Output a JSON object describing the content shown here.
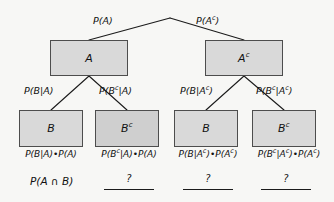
{
  "diagram": {
    "colors": {
      "background": "#f7f7f5",
      "box_fill": "#d9d9d9",
      "box_fill_dark": "#cfcfcf",
      "box_border": "#4d4d4d",
      "line": "#1b1b1b",
      "text": "#111111"
    }
  },
  "nodes": {
    "level1": [
      {
        "id": "A",
        "base": "A",
        "sup": ""
      },
      {
        "id": "Ac",
        "base": "A",
        "sup": "c"
      }
    ],
    "level2": [
      {
        "id": "B1",
        "base": "B",
        "sup": ""
      },
      {
        "id": "Bc1",
        "base": "B",
        "sup": "c"
      },
      {
        "id": "B2",
        "base": "B",
        "sup": ""
      },
      {
        "id": "Bc2",
        "base": "B",
        "sup": "c"
      }
    ]
  },
  "edge_labels": {
    "root_left": {
      "prefix": "P(A",
      "sup": "",
      "suffix": ")"
    },
    "root_right": {
      "prefix": "P(A",
      "sup": "c",
      "suffix": ")"
    },
    "a_left": {
      "text": "P(B|A)"
    },
    "a_right": {
      "prefix": "P(B",
      "sup": "c",
      "suffix": "|A)"
    },
    "ac_left": {
      "prefix": "P(B|A",
      "sup": "c",
      "suffix": ")"
    },
    "ac_right": {
      "prefix": "P(B",
      "sup": "c",
      "mid": "|A",
      "sup2": "c",
      "suffix": ")"
    }
  },
  "products": [
    {
      "p1": "P(B|A)",
      "dot": "•",
      "p2": "P(A)"
    },
    {
      "p1a": "P(B",
      "p1sup": "c",
      "p1b": "|A)",
      "dot": "•",
      "p2": "P(A)"
    },
    {
      "p1a": "P(B|A",
      "p1sup": "c",
      "p1b": ")",
      "dot": "•",
      "p2a": "P(A",
      "p2sup": "c",
      "p2b": ")"
    },
    {
      "p1a": "P(B",
      "p1sup": "c",
      "p1mid": "|A",
      "p1sup2": "c",
      "p1b": ")",
      "dot": "•",
      "p2a": "P(A",
      "p2sup": "c",
      "p2b": ")"
    }
  ],
  "bottom": {
    "intersection_label": "P(A ∩ B)",
    "blanks": [
      "?",
      "?",
      "?"
    ]
  }
}
